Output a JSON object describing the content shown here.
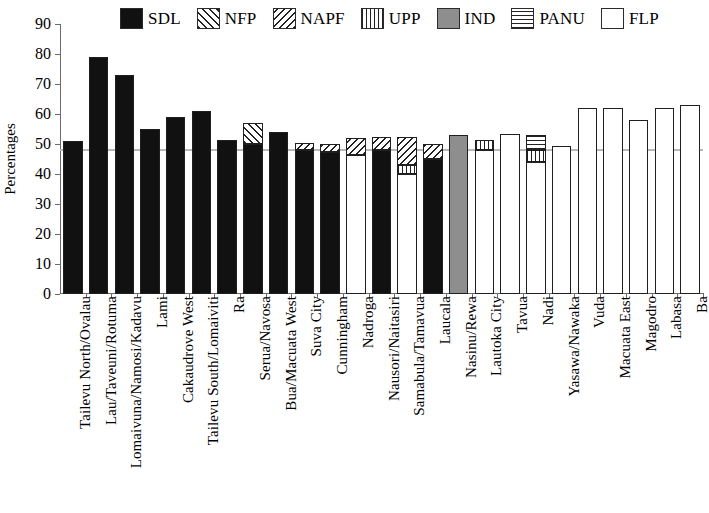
{
  "chart_data": {
    "type": "bar",
    "title": "",
    "subtitle": "",
    "xlabel": "",
    "ylabel": "Percentages",
    "ylim": [
      0,
      90
    ],
    "yticks": [
      0,
      10,
      20,
      30,
      40,
      50,
      60,
      70,
      80,
      90
    ],
    "grid": false,
    "stacked": true,
    "legend_position": "top",
    "reference_line": 48,
    "legend": [
      {
        "name": "SDL",
        "pattern": "solid-black",
        "css": "pat-solid"
      },
      {
        "name": "NFP",
        "pattern": "forward-diagonal",
        "css": "pat-fslash"
      },
      {
        "name": "NAPF",
        "pattern": "backward-diagonal",
        "css": "pat-bslash"
      },
      {
        "name": "UPP",
        "pattern": "vertical-lines",
        "css": "pat-vert"
      },
      {
        "name": "IND",
        "pattern": "solid-gray",
        "css": "pat-gray"
      },
      {
        "name": "PANU",
        "pattern": "horizontal-lines",
        "css": "pat-horiz"
      },
      {
        "name": "FLP",
        "pattern": "empty-white",
        "css": "pat-white"
      }
    ],
    "categories": [
      "Tailevu North/Ovalau",
      "Lau/Taveuni/Rotuma",
      "Lomaivuna/Namosi/Kadavu",
      "Lami",
      "Cakaudrove West",
      "Tailevu South/Lomaiviti",
      "Ra",
      "Serua/Navosa",
      "Bua/Macuata West",
      "Suva City",
      "Cunningham",
      "Nadroga",
      "Nausori/Naitasiri",
      "Samabula/Tamavua",
      "Laucala",
      "Nasinu/Rewa",
      "Lautoka City",
      "Tavua",
      "Nadi",
      "Yasawa/Nawaka",
      "Vuda",
      "Macuata East",
      "Magodro",
      "Labasa",
      "Ba"
    ],
    "bars": [
      {
        "category": "Tailevu North/Ovalau",
        "total": 51,
        "segments": [
          {
            "party": "SDL",
            "value": 51
          }
        ]
      },
      {
        "category": "Lau/Taveuni/Rotuma",
        "total": 79,
        "segments": [
          {
            "party": "SDL",
            "value": 79
          }
        ]
      },
      {
        "category": "Lomaivuna/Namosi/Kadavu",
        "total": 73,
        "segments": [
          {
            "party": "SDL",
            "value": 73
          }
        ]
      },
      {
        "category": "Lami",
        "total": 55,
        "segments": [
          {
            "party": "SDL",
            "value": 55
          }
        ]
      },
      {
        "category": "Cakaudrove West",
        "total": 59,
        "segments": [
          {
            "party": "SDL",
            "value": 59
          }
        ]
      },
      {
        "category": "Tailevu South/Lomaiviti",
        "total": 61,
        "segments": [
          {
            "party": "SDL",
            "value": 61
          }
        ]
      },
      {
        "category": "Ra",
        "total": 51.5,
        "segments": [
          {
            "party": "SDL",
            "value": 51.5
          }
        ]
      },
      {
        "category": "Serua/Navosa",
        "total": 57,
        "segments": [
          {
            "party": "SDL",
            "value": 50
          },
          {
            "party": "NFP",
            "value": 7
          }
        ]
      },
      {
        "category": "Bua/Macuata West",
        "total": 54,
        "segments": [
          {
            "party": "SDL",
            "value": 54
          }
        ]
      },
      {
        "category": "Suva City",
        "total": 50.5,
        "segments": [
          {
            "party": "SDL",
            "value": 48
          },
          {
            "party": "NAPF",
            "value": 2.5
          }
        ]
      },
      {
        "category": "Cunningham",
        "total": 50,
        "segments": [
          {
            "party": "SDL",
            "value": 47.5
          },
          {
            "party": "NAPF",
            "value": 2.5
          }
        ]
      },
      {
        "category": "Nadroga",
        "total": 52,
        "segments": [
          {
            "party": "FLP",
            "value": 46.5
          },
          {
            "party": "NAPF",
            "value": 5.5
          }
        ]
      },
      {
        "category": "Nausori/Naitasiri",
        "total": 52.5,
        "segments": [
          {
            "party": "SDL",
            "value": 48
          },
          {
            "party": "NAPF",
            "value": 4.5
          }
        ]
      },
      {
        "category": "Samabula/Tamavua",
        "total": 52.5,
        "segments": [
          {
            "party": "FLP",
            "value": 40
          },
          {
            "party": "UPP",
            "value": 3
          },
          {
            "party": "NAPF",
            "value": 9.5
          }
        ]
      },
      {
        "category": "Laucala",
        "total": 50,
        "segments": [
          {
            "party": "SDL",
            "value": 45
          },
          {
            "party": "NAPF",
            "value": 5
          }
        ]
      },
      {
        "category": "Nasinu/Rewa",
        "total": 53,
        "segments": [
          {
            "party": "IND",
            "value": 53
          }
        ]
      },
      {
        "category": "Lautoka City",
        "total": 51.5,
        "segments": [
          {
            "party": "FLP",
            "value": 48
          },
          {
            "party": "UPP",
            "value": 3.5
          }
        ]
      },
      {
        "category": "Tavua",
        "total": 53.5,
        "segments": [
          {
            "party": "FLP",
            "value": 53.5
          }
        ]
      },
      {
        "category": "Nadi",
        "total": 53,
        "segments": [
          {
            "party": "FLP",
            "value": 44
          },
          {
            "party": "UPP",
            "value": 4
          },
          {
            "party": "PANU",
            "value": 5
          }
        ]
      },
      {
        "category": "Yasawa/Nawaka",
        "total": 49.5,
        "segments": [
          {
            "party": "FLP",
            "value": 49.5
          }
        ]
      },
      {
        "category": "Vuda",
        "total": 62,
        "segments": [
          {
            "party": "FLP",
            "value": 62
          }
        ]
      },
      {
        "category": "Macuata East",
        "total": 62,
        "segments": [
          {
            "party": "FLP",
            "value": 62
          }
        ]
      },
      {
        "category": "Magodro",
        "total": 58,
        "segments": [
          {
            "party": "FLP",
            "value": 58
          }
        ]
      },
      {
        "category": "Labasa",
        "total": 62,
        "segments": [
          {
            "party": "FLP",
            "value": 62
          }
        ]
      },
      {
        "category": "Ba",
        "total": 63,
        "segments": [
          {
            "party": "FLP",
            "value": 63
          }
        ]
      }
    ]
  }
}
